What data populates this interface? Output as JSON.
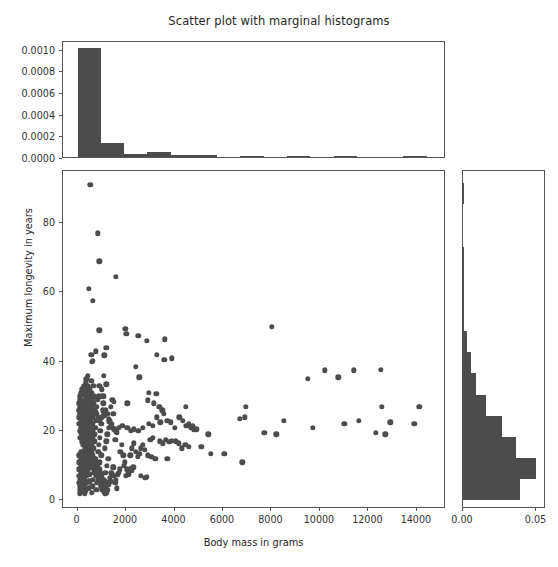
{
  "chart_data": {
    "type": "scatter",
    "title": "Scatter plot with marginal histograms",
    "xlabel": "Body mass in grams",
    "ylabel": "Maximum longevity in years",
    "xlim": [
      -600,
      15200
    ],
    "ylim": [
      -2.5,
      95
    ],
    "xticks": [
      0,
      2000,
      4000,
      6000,
      8000,
      10000,
      12000,
      14000
    ],
    "xticklabels": [
      "0",
      "2000",
      "4000",
      "6000",
      "8000",
      "10000",
      "12000",
      "14000"
    ],
    "yticks": [
      0,
      20,
      40,
      60,
      80
    ],
    "yticklabels": [
      "0",
      "20",
      "40",
      "60",
      "80"
    ],
    "grid": false,
    "legend": null,
    "marker_color": "#4c4c4c",
    "bar_color": "#4c4c4c",
    "top_histogram": {
      "type": "bar",
      "orientation": "vertical",
      "normalized": "density",
      "ylim": [
        0,
        0.00108
      ],
      "yticks": [
        0.0,
        0.0002,
        0.0004,
        0.0006,
        0.0008,
        0.001
      ],
      "yticklabels": [
        "0.0000",
        "0.0002",
        "0.0004",
        "0.0006",
        "0.0008",
        "0.0010"
      ],
      "bin_edges": [
        0,
        960,
        1920,
        2880,
        3840,
        4800,
        5760,
        6720,
        7680,
        8640,
        9600,
        10560,
        11520,
        12480,
        13440,
        14400
      ],
      "densities": [
        0.001005,
        0.000133,
        2.55e-05,
        4.3e-05,
        2.05e-05,
        1.75e-05,
        0.0,
        3.6e-06,
        0.0,
        4e-06,
        0.0,
        3.4e-06,
        0.0,
        0.0,
        3.2e-06
      ]
    },
    "right_histogram": {
      "type": "bar",
      "orientation": "horizontal",
      "normalized": "density",
      "xlim": [
        0,
        0.0565
      ],
      "xticks": [
        0.0,
        0.05
      ],
      "xticklabels": [
        "0.00",
        "0.05"
      ],
      "bin_edges": [
        0,
        6.1,
        12.2,
        18.3,
        24.4,
        30.5,
        36.6,
        42.7,
        48.8,
        54.9,
        61.0,
        67.1,
        73.2,
        79.3,
        85.4,
        91.5
      ],
      "densities": [
        0.0385,
        0.0498,
        0.036,
        0.0267,
        0.0155,
        0.0088,
        0.0055,
        0.0025,
        0.001,
        0.0006,
        0.0006,
        0.0005,
        0.0,
        0.0,
        0.0004
      ]
    },
    "points": [
      [
        520,
        91
      ],
      [
        840,
        77
      ],
      [
        900,
        69
      ],
      [
        1580,
        64.5
      ],
      [
        460,
        61
      ],
      [
        620,
        57.5
      ],
      [
        900,
        49
      ],
      [
        1970,
        49.5
      ],
      [
        2010,
        48
      ],
      [
        2500,
        47.5
      ],
      [
        8020,
        50
      ],
      [
        2850,
        46
      ],
      [
        3600,
        46.5
      ],
      [
        1180,
        44
      ],
      [
        760,
        43
      ],
      [
        560,
        42
      ],
      [
        1100,
        41.8
      ],
      [
        3280,
        42
      ],
      [
        3900,
        41
      ],
      [
        3580,
        40.5
      ],
      [
        2400,
        38.5
      ],
      [
        640,
        40.2
      ],
      [
        590,
        40
      ],
      [
        10200,
        37.5
      ],
      [
        11400,
        37.5
      ],
      [
        12500,
        37.7
      ],
      [
        2550,
        35.5
      ],
      [
        1090,
        36
      ],
      [
        430,
        36
      ],
      [
        360,
        35
      ],
      [
        560,
        34.5
      ],
      [
        1180,
        33.5
      ],
      [
        900,
        33
      ],
      [
        650,
        33
      ],
      [
        1010,
        32
      ],
      [
        2950,
        31
      ],
      [
        9500,
        35
      ],
      [
        10750,
        35.5
      ],
      [
        3250,
        30.8
      ],
      [
        1000,
        30
      ],
      [
        870,
        30
      ],
      [
        780,
        29.8
      ],
      [
        1500,
        28.5
      ],
      [
        2050,
        28
      ],
      [
        2910,
        28.8
      ],
      [
        3140,
        28
      ],
      [
        4460,
        27
      ],
      [
        3380,
        27
      ],
      [
        3500,
        26
      ],
      [
        6950,
        27
      ],
      [
        12550,
        27
      ],
      [
        14100,
        27
      ],
      [
        360,
        28
      ],
      [
        400,
        27.5
      ],
      [
        300,
        27
      ],
      [
        250,
        26.5
      ],
      [
        230,
        25
      ],
      [
        290,
        24.5
      ],
      [
        210,
        24
      ],
      [
        330,
        23.5
      ],
      [
        420,
        23
      ],
      [
        480,
        22.5
      ],
      [
        520,
        24
      ],
      [
        600,
        25
      ],
      [
        700,
        26
      ],
      [
        760,
        25.5
      ],
      [
        830,
        24
      ],
      [
        900,
        23
      ],
      [
        1000,
        22
      ],
      [
        1100,
        24.5
      ],
      [
        1160,
        26
      ],
      [
        1220,
        25
      ],
      [
        1280,
        23.5
      ],
      [
        1310,
        22.8
      ],
      [
        1400,
        22
      ],
      [
        1460,
        21
      ],
      [
        1520,
        20.5
      ],
      [
        1600,
        19.8
      ],
      [
        1700,
        21
      ],
      [
        1850,
        21.5
      ],
      [
        2060,
        21
      ],
      [
        2200,
        20
      ],
      [
        2330,
        20.5
      ],
      [
        2500,
        20
      ],
      [
        2700,
        21
      ],
      [
        2950,
        22
      ],
      [
        3100,
        21.5
      ],
      [
        3280,
        24
      ],
      [
        3420,
        22.5
      ],
      [
        3560,
        25
      ],
      [
        3700,
        23
      ],
      [
        3850,
        22.5
      ],
      [
        4000,
        21
      ],
      [
        4200,
        24
      ],
      [
        4350,
        23
      ],
      [
        4480,
        21.5
      ],
      [
        4600,
        22
      ],
      [
        4700,
        21
      ],
      [
        4800,
        20.5
      ],
      [
        6700,
        23.5
      ],
      [
        6900,
        24
      ],
      [
        8500,
        23
      ],
      [
        9700,
        21
      ],
      [
        11000,
        22
      ],
      [
        11600,
        23
      ],
      [
        12900,
        22.5
      ],
      [
        13900,
        22
      ],
      [
        7700,
        19.5
      ],
      [
        5400,
        19
      ],
      [
        8200,
        19
      ],
      [
        12300,
        19.5
      ],
      [
        12700,
        19
      ],
      [
        80,
        22
      ],
      [
        100,
        20
      ],
      [
        120,
        18
      ],
      [
        140,
        19.5
      ],
      [
        160,
        21
      ],
      [
        180,
        17
      ],
      [
        200,
        18.5
      ],
      [
        220,
        19
      ],
      [
        240,
        16
      ],
      [
        260,
        17.5
      ],
      [
        280,
        20
      ],
      [
        300,
        15
      ],
      [
        320,
        16.5
      ],
      [
        340,
        18
      ],
      [
        360,
        14
      ],
      [
        380,
        15.5
      ],
      [
        400,
        17
      ],
      [
        420,
        13
      ],
      [
        440,
        14.5
      ],
      [
        460,
        16
      ],
      [
        480,
        12
      ],
      [
        500,
        13.5
      ],
      [
        520,
        15
      ],
      [
        540,
        11
      ],
      [
        560,
        12.5
      ],
      [
        580,
        14
      ],
      [
        600,
        10
      ],
      [
        620,
        11.5
      ],
      [
        640,
        13
      ],
      [
        660,
        9
      ],
      [
        680,
        10.5
      ],
      [
        700,
        12
      ],
      [
        720,
        8
      ],
      [
        740,
        9.5
      ],
      [
        760,
        11
      ],
      [
        780,
        7
      ],
      [
        800,
        8.5
      ],
      [
        820,
        10
      ],
      [
        840,
        6
      ],
      [
        860,
        7.5
      ],
      [
        880,
        9
      ],
      [
        900,
        5
      ],
      [
        920,
        6.5
      ],
      [
        940,
        8
      ],
      [
        960,
        4
      ],
      [
        980,
        5.5
      ],
      [
        1000,
        7
      ],
      [
        1020,
        3
      ],
      [
        1040,
        4.5
      ],
      [
        1060,
        6
      ],
      [
        1080,
        2.5
      ],
      [
        1100,
        4
      ],
      [
        1120,
        5.5
      ],
      [
        1140,
        2
      ],
      [
        1160,
        3.5
      ],
      [
        1180,
        5
      ],
      [
        1200,
        2.2
      ],
      [
        1240,
        3
      ],
      [
        1290,
        4.5
      ],
      [
        1340,
        6.5
      ],
      [
        1390,
        8
      ],
      [
        1450,
        9.5
      ],
      [
        1500,
        7
      ],
      [
        1560,
        5
      ],
      [
        1620,
        3.5
      ],
      [
        1700,
        8
      ],
      [
        1760,
        14
      ],
      [
        1820,
        16
      ],
      [
        1880,
        13
      ],
      [
        1950,
        11
      ],
      [
        2020,
        9
      ],
      [
        2100,
        7.5
      ],
      [
        2180,
        13
      ],
      [
        2250,
        15
      ],
      [
        2320,
        16.5
      ],
      [
        2400,
        14
      ],
      [
        2480,
        12.5
      ],
      [
        2550,
        13.5
      ],
      [
        2620,
        15
      ],
      [
        2700,
        16
      ],
      [
        2780,
        14.5
      ],
      [
        2850,
        6.8
      ],
      [
        2900,
        13
      ],
      [
        3000,
        17.5
      ],
      [
        3100,
        18
      ],
      [
        3200,
        12
      ],
      [
        3400,
        17
      ],
      [
        3520,
        16.5
      ],
      [
        3650,
        17.5
      ],
      [
        3780,
        16.8
      ],
      [
        3900,
        17.2
      ],
      [
        4050,
        17
      ],
      [
        4180,
        16.5
      ],
      [
        4300,
        15
      ],
      [
        4450,
        16
      ],
      [
        4600,
        15.5
      ],
      [
        4750,
        21.5
      ],
      [
        4900,
        20.5
      ],
      [
        5100,
        15.5
      ],
      [
        5500,
        13.5
      ],
      [
        6050,
        13.5
      ],
      [
        6800,
        11
      ],
      [
        60,
        24
      ],
      [
        70,
        26
      ],
      [
        80,
        28
      ],
      [
        90,
        30
      ],
      [
        100,
        25
      ],
      [
        110,
        27
      ],
      [
        120,
        29
      ],
      [
        130,
        31
      ],
      [
        140,
        23
      ],
      [
        150,
        22
      ],
      [
        160,
        24.5
      ],
      [
        170,
        26.5
      ],
      [
        180,
        28.5
      ],
      [
        190,
        30.5
      ],
      [
        200,
        32
      ],
      [
        210,
        21
      ],
      [
        220,
        23
      ],
      [
        230,
        25
      ],
      [
        240,
        27
      ],
      [
        250,
        29
      ],
      [
        260,
        31
      ],
      [
        270,
        33
      ],
      [
        280,
        20
      ],
      [
        290,
        22
      ],
      [
        300,
        24
      ],
      [
        310,
        26
      ],
      [
        320,
        28
      ],
      [
        330,
        30
      ],
      [
        340,
        32
      ],
      [
        350,
        34
      ],
      [
        360,
        19
      ],
      [
        370,
        21
      ],
      [
        380,
        23
      ],
      [
        390,
        25
      ],
      [
        400,
        27
      ],
      [
        410,
        29
      ],
      [
        420,
        31
      ],
      [
        430,
        33
      ],
      [
        440,
        18
      ],
      [
        450,
        20
      ],
      [
        460,
        22
      ],
      [
        470,
        24
      ],
      [
        480,
        26
      ],
      [
        490,
        28
      ],
      [
        500,
        30
      ],
      [
        510,
        32
      ],
      [
        520,
        17
      ],
      [
        530,
        19
      ],
      [
        540,
        21
      ],
      [
        550,
        23
      ],
      [
        560,
        25
      ],
      [
        570,
        27
      ],
      [
        580,
        29
      ],
      [
        590,
        31
      ],
      [
        600,
        16
      ],
      [
        610,
        18
      ],
      [
        620,
        20
      ],
      [
        630,
        22
      ],
      [
        640,
        24
      ],
      [
        650,
        26
      ],
      [
        660,
        28
      ],
      [
        670,
        30
      ],
      [
        680,
        15
      ],
      [
        700,
        17
      ],
      [
        720,
        19
      ],
      [
        740,
        21
      ],
      [
        760,
        23
      ],
      [
        780,
        25
      ],
      [
        800,
        27
      ],
      [
        820,
        29
      ],
      [
        850,
        14
      ],
      [
        880,
        16
      ],
      [
        910,
        18
      ],
      [
        940,
        20
      ],
      [
        970,
        22
      ],
      [
        1000,
        24
      ],
      [
        1030,
        26
      ],
      [
        1060,
        28
      ],
      [
        1090,
        30
      ],
      [
        1130,
        15
      ],
      [
        1180,
        17
      ],
      [
        1230,
        19
      ],
      [
        1280,
        21
      ],
      [
        1330,
        23
      ],
      [
        1380,
        27
      ],
      [
        1430,
        29
      ],
      [
        1480,
        25
      ],
      [
        1550,
        17.5
      ],
      [
        1630,
        19.5
      ],
      [
        40,
        13
      ],
      [
        50,
        11
      ],
      [
        60,
        9
      ],
      [
        70,
        7
      ],
      [
        80,
        5
      ],
      [
        90,
        3
      ],
      [
        100,
        2
      ],
      [
        110,
        4
      ],
      [
        120,
        6
      ],
      [
        130,
        8
      ],
      [
        140,
        10
      ],
      [
        150,
        12
      ],
      [
        160,
        14
      ],
      [
        170,
        2.5
      ],
      [
        180,
        4.5
      ],
      [
        190,
        6.5
      ],
      [
        200,
        8.5
      ],
      [
        210,
        10.5
      ],
      [
        220,
        12.5
      ],
      [
        230,
        3
      ],
      [
        240,
        5
      ],
      [
        250,
        7
      ],
      [
        260,
        9
      ],
      [
        270,
        11
      ],
      [
        280,
        13
      ],
      [
        290,
        2
      ],
      [
        300,
        4
      ],
      [
        310,
        6
      ],
      [
        320,
        8
      ],
      [
        330,
        10
      ],
      [
        340,
        12
      ],
      [
        350,
        2.8
      ],
      [
        370,
        5
      ],
      [
        390,
        7
      ],
      [
        410,
        9
      ],
      [
        430,
        11
      ],
      [
        450,
        13
      ],
      [
        470,
        3.5
      ],
      [
        490,
        5.5
      ],
      [
        510,
        7.5
      ],
      [
        530,
        9.5
      ],
      [
        550,
        11.5
      ],
      [
        580,
        2.2
      ],
      [
        610,
        4
      ],
      [
        640,
        6
      ],
      [
        670,
        8
      ],
      [
        700,
        10
      ],
      [
        730,
        12
      ],
      [
        770,
        3
      ],
      [
        810,
        5
      ],
      [
        850,
        7
      ],
      [
        890,
        9
      ],
      [
        930,
        11
      ],
      [
        980,
        13
      ],
      [
        1030,
        3.8
      ],
      [
        1090,
        6
      ],
      [
        1150,
        8
      ],
      [
        1210,
        10
      ],
      [
        1270,
        12
      ],
      [
        1350,
        5.5
      ],
      [
        1420,
        7.5
      ],
      [
        1500,
        9.5
      ],
      [
        1580,
        6
      ],
      [
        1660,
        7.5
      ],
      [
        1750,
        9
      ],
      [
        1900,
        10
      ],
      [
        2150,
        9
      ],
      [
        2300,
        9.5
      ],
      [
        2600,
        7
      ],
      [
        2800,
        6.5
      ],
      [
        3050,
        12.5
      ],
      [
        3700,
        12
      ],
      [
        2250,
        8.5
      ],
      [
        1980,
        7
      ]
    ]
  }
}
